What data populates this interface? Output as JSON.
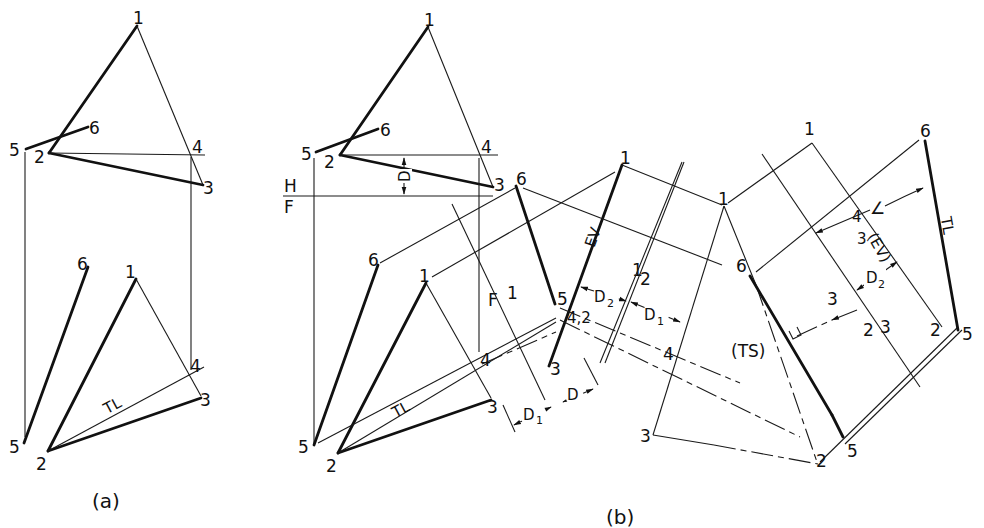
{
  "figure": {
    "part_a": {
      "caption": "(a)",
      "top_view_labels": {
        "p1": "1",
        "p2": "2",
        "p3": "3",
        "p4": "4",
        "p5": "5",
        "p6": "6"
      },
      "front_view_labels": {
        "p1": "1",
        "p2": "2",
        "p3": "3",
        "p4": "4",
        "p5": "5",
        "p6": "6",
        "tl": "TL"
      }
    },
    "part_b": {
      "caption": "(b)",
      "top_view_labels": {
        "p1": "1",
        "p2": "2",
        "p3": "3",
        "p4": "4",
        "p5": "5",
        "p6": "6",
        "dim": "D"
      },
      "fold_line_hf": {
        "upper": "H",
        "lower": "F"
      },
      "front_view_labels": {
        "p1": "1",
        "p2": "2",
        "p3": "3",
        "p4": "4",
        "p5": "5",
        "p6": "6",
        "tl": "TL"
      },
      "fold_line_f1": {
        "left": "F",
        "right": "1"
      },
      "aux1_labels": {
        "p1": "1",
        "p3": "3",
        "p5": "5",
        "p6": "6",
        "p42": "4,2",
        "ev": "EV",
        "d": "D",
        "d1": "D",
        "d1_sub": "1"
      },
      "fold_line_12": {
        "left": "1",
        "right": "2",
        "d2": "D",
        "d2_sub": "2",
        "d1": "D",
        "d1_sub": "1"
      },
      "aux2_labels": {
        "p1": "1",
        "p2": "2",
        "p3": "3",
        "p4": "4",
        "p5": "5",
        "p6": "6",
        "ts": "(TS)"
      },
      "aux3_labels": {
        "p1": "1",
        "p2a": "2",
        "p2b": "2",
        "p3a": "3",
        "p3b": "3",
        "p3c": "3",
        "p4": "4",
        "p5": "5",
        "p6": "6",
        "ev": "(EV)",
        "tl": "TL",
        "angle": "∠",
        "d2": "D",
        "d2_sub": "2"
      }
    }
  }
}
